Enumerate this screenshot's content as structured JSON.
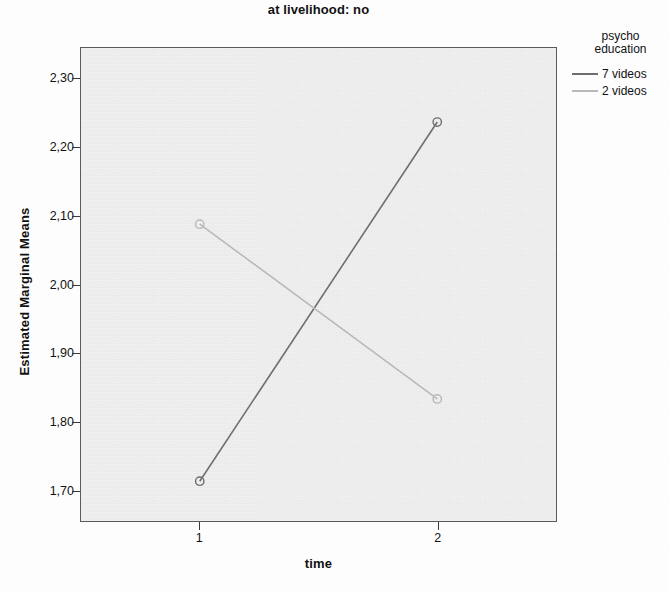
{
  "title": {
    "line1": "",
    "line2": "at livelihood: no"
  },
  "axes": {
    "x_label": "time",
    "y_label": "Estimated Marginal Means",
    "x_tick_labels": [
      "1",
      "2"
    ],
    "y_tick_labels": [
      "1,70",
      "1,80",
      "1,90",
      "2,00",
      "2,10",
      "2,20",
      "2,30"
    ]
  },
  "legend": {
    "title": "psycho\neducation",
    "entries": [
      {
        "label": "7 videos",
        "color": "#6e6e6e"
      },
      {
        "label": "2 videos",
        "color": "#b9b9b9"
      }
    ]
  },
  "colors": {
    "plot_background": "#ececec",
    "frame": "#5a5a5a",
    "series_1": "#6e6e6e",
    "series_2": "#b9b9b9"
  },
  "chart_data": {
    "type": "line",
    "title": "at livelihood: no",
    "xlabel": "time",
    "ylabel": "Estimated Marginal Means",
    "x": [
      1,
      2
    ],
    "xlim": [
      0.5,
      2.5
    ],
    "ylim": [
      1.655,
      2.345
    ],
    "ytick_values": [
      1.7,
      1.8,
      1.9,
      2.0,
      2.1,
      2.2,
      2.3
    ],
    "xtick_values": [
      1,
      2
    ],
    "grid": false,
    "legend_position": "right",
    "legend_title": "psycho education",
    "marker": "open-circle",
    "series": [
      {
        "name": "7 videos",
        "values": [
          1.713,
          2.237
        ],
        "color": "#6e6e6e"
      },
      {
        "name": "2 videos",
        "values": [
          2.088,
          1.833
        ],
        "color": "#b9b9b9"
      }
    ]
  }
}
